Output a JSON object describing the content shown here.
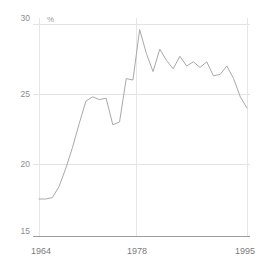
{
  "chart_data": {
    "type": "line",
    "title": "",
    "subtitle": "",
    "xlabel": "",
    "ylabel": "%",
    "unit_label": "%",
    "xlim": [
      1964,
      1995
    ],
    "ylim": [
      15,
      30
    ],
    "grid": true,
    "legend": "none",
    "y_ticks": [
      30,
      25,
      20,
      15
    ],
    "y_tick_labels": [
      "30",
      "25",
      "20",
      "15"
    ],
    "x_ticks": [
      1964,
      1978,
      1995
    ],
    "x_tick_labels": [
      "1964",
      "1978",
      "1995"
    ],
    "series": [
      {
        "name": "share",
        "color": "#a9a9a9",
        "x": [
          1964,
          1965,
          1966,
          1967,
          1968,
          1969,
          1970,
          1971,
          1972,
          1973,
          1974,
          1975,
          1976,
          1977,
          1978,
          1979,
          1980,
          1981,
          1982,
          1983,
          1984,
          1985,
          1986,
          1987,
          1988,
          1989,
          1990,
          1991,
          1992,
          1993,
          1994,
          1995
        ],
        "values": [
          17.5,
          17.5,
          17.6,
          18.4,
          19.7,
          21.2,
          22.9,
          24.5,
          24.8,
          24.6,
          24.7,
          22.8,
          23.0,
          26.1,
          26.0,
          29.6,
          27.9,
          26.6,
          28.2,
          27.4,
          26.8,
          27.7,
          27.0,
          27.3,
          26.9,
          27.3,
          26.3,
          26.4,
          27.0,
          26.1,
          24.8,
          24.0
        ]
      }
    ]
  },
  "axes": {
    "y_unit": "%",
    "y_labels": [
      "30",
      "25",
      "20",
      "15"
    ],
    "x_labels": [
      "1964",
      "1978",
      "1995"
    ]
  }
}
